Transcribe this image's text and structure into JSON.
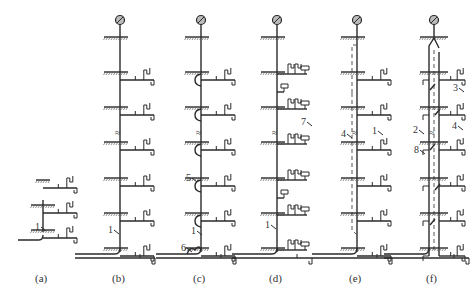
{
  "figure": {
    "panels": [
      {
        "id": "a",
        "caption": "(a)",
        "stack_x": 43,
        "top_y": 205,
        "floors": [
          205,
          230
        ],
        "bottom_y": 238,
        "has_vent_cap": false,
        "callouts": [
          {
            "text": "1",
            "x": 35,
            "y": 230
          }
        ]
      },
      {
        "id": "b",
        "caption": "(b)",
        "stack_x": 120,
        "top_y": 22,
        "floors": [
          37,
          72,
          107,
          142,
          178,
          213,
          248
        ],
        "bottom_y": 258,
        "has_vent_cap": true,
        "callouts": [
          {
            "text": "1",
            "x": 108,
            "y": 233
          }
        ]
      },
      {
        "id": "c",
        "caption": "(c)",
        "stack_x": 201,
        "top_y": 22,
        "floors": [
          37,
          72,
          107,
          142,
          178,
          213,
          248
        ],
        "bottom_y": 258,
        "has_vent_cap": true,
        "callouts": [
          {
            "text": "5",
            "x": 186,
            "y": 181
          },
          {
            "text": "1",
            "x": 191,
            "y": 234
          },
          {
            "text": "6",
            "x": 181,
            "y": 251
          }
        ]
      },
      {
        "id": "d",
        "caption": "(d)",
        "stack_x": 277,
        "top_y": 22,
        "floors": [
          37,
          72,
          107,
          142,
          178,
          213,
          248
        ],
        "bottom_y": 258,
        "has_vent_cap": true,
        "callouts": [
          {
            "text": "7",
            "x": 301,
            "y": 125
          },
          {
            "text": "1",
            "x": 265,
            "y": 228
          }
        ]
      },
      {
        "id": "e",
        "caption": "(e)",
        "stack_x": 357,
        "top_y": 22,
        "floors": [
          37,
          72,
          107,
          142,
          178,
          213,
          248
        ],
        "bottom_y": 258,
        "has_vent_cap": true,
        "callouts": [
          {
            "text": "4",
            "x": 341,
            "y": 137
          },
          {
            "text": "1",
            "x": 372,
            "y": 134
          }
        ]
      },
      {
        "id": "f",
        "caption": "(f)",
        "stack_x": 434,
        "top_y": 22,
        "floors": [
          37,
          72,
          107,
          142,
          178,
          213,
          248
        ],
        "bottom_y": 258,
        "has_vent_cap": true,
        "callouts": [
          {
            "text": "3",
            "x": 453,
            "y": 91
          },
          {
            "text": "2",
            "x": 413,
            "y": 133
          },
          {
            "text": "4",
            "x": 452,
            "y": 129
          },
          {
            "text": "8",
            "x": 414,
            "y": 153
          }
        ]
      }
    ],
    "legend_numbers": [
      "1",
      "2",
      "3",
      "4",
      "5",
      "6",
      "7",
      "8"
    ]
  }
}
